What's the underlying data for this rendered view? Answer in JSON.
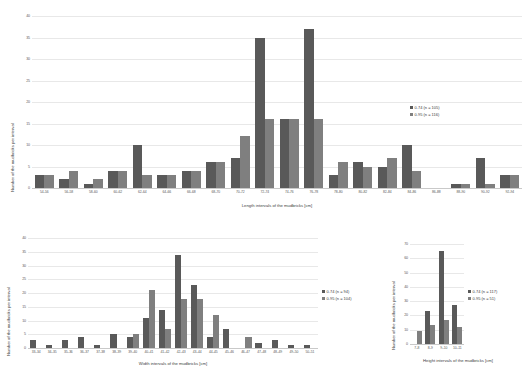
{
  "figure": {
    "background": "#ffffff",
    "series_colors": {
      "s1": "#595959",
      "s2": "#7f7f7f"
    }
  },
  "chart_data": [
    {
      "id": "length-chart",
      "type": "bar",
      "title": "",
      "xlabel": "Length intervals of the mudbricks [cm]",
      "ylabel": "Number of the mudbricks per interval",
      "ylim": [
        0,
        40
      ],
      "yticks": [
        "0",
        "5",
        "10",
        "15",
        "20",
        "25",
        "30",
        "35",
        "40"
      ],
      "grid": true,
      "legend_position": "right",
      "categories": [
        "54–56",
        "56–58",
        "58–60",
        "60–62",
        "62–64",
        "64–66",
        "66–68",
        "68–70",
        "70–72",
        "72–74",
        "74–76",
        "76–78",
        "78–80",
        "80–82",
        "82–84",
        "84–86",
        "86–88",
        "88–90",
        "90–92",
        "92–94"
      ],
      "series": [
        {
          "name": "0.74 (n = 105)",
          "color": "#595959",
          "values": [
            3,
            2,
            1,
            4,
            10,
            3,
            4,
            6,
            7,
            35,
            16,
            37,
            3,
            6,
            5,
            10,
            0,
            1,
            7,
            3
          ]
        },
        {
          "name": "0.95 (n = 116)",
          "color": "#7f7f7f",
          "values": [
            3,
            4,
            2,
            4,
            3,
            3,
            4,
            6,
            12,
            16,
            16,
            16,
            6,
            5,
            7,
            4,
            0,
            1,
            1,
            3
          ]
        }
      ]
    },
    {
      "id": "width-chart",
      "type": "bar",
      "title": "",
      "xlabel": "Width intervals of the mudbricks [cm]",
      "ylabel": "Number of the mudbricks per interval",
      "ylim": [
        0,
        40
      ],
      "yticks": [
        "0",
        "5",
        "10",
        "15",
        "20",
        "25",
        "30",
        "35",
        "40"
      ],
      "grid": true,
      "legend_position": "right",
      "categories": [
        "33–34",
        "34–35",
        "35–36",
        "36–37",
        "37–38",
        "38–39",
        "39–40",
        "40–41",
        "41–42",
        "42–43",
        "43–44",
        "44–45",
        "45–46",
        "46–47",
        "47–48",
        "48–49",
        "49–50",
        "50–51"
      ],
      "series": [
        {
          "name": "0.74 (n = 94)",
          "color": "#595959",
          "values": [
            3,
            1,
            3,
            4,
            1,
            5,
            4,
            11,
            14,
            34,
            23,
            4,
            7,
            0,
            2,
            3,
            1,
            1
          ]
        },
        {
          "name": "0.95 (n = 104)",
          "color": "#7f7f7f",
          "values": [
            0,
            0,
            0,
            0,
            0,
            0,
            5,
            21,
            7,
            18,
            18,
            12,
            0,
            4,
            0,
            0,
            0,
            0
          ]
        }
      ]
    },
    {
      "id": "height-chart",
      "type": "bar",
      "title": "",
      "xlabel": "Height intervals of the mudbricks [cm]",
      "ylabel": "Number of the mudbricks per interval",
      "ylim": [
        0,
        70
      ],
      "yticks": [
        "0",
        "10",
        "20",
        "30",
        "40",
        "50",
        "60",
        "70"
      ],
      "grid": true,
      "legend_position": "right",
      "categories": [
        "7–8",
        "8–9",
        "9–10",
        "10–11"
      ],
      "series": [
        {
          "name": "0.74 (n = 117)",
          "color": "#595959",
          "values": [
            0,
            23,
            65,
            27
          ]
        },
        {
          "name": "0.95 (n = 51)",
          "color": "#7f7f7f",
          "values": [
            9,
            13,
            17,
            12
          ]
        }
      ]
    }
  ]
}
